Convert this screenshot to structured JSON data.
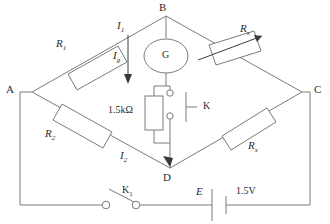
{
  "diagram": {
    "type": "wheatstone-bridge-circuit",
    "nodes": [
      {
        "id": "A",
        "label": "A"
      },
      {
        "id": "B",
        "label": "B"
      },
      {
        "id": "C",
        "label": "C"
      },
      {
        "id": "D",
        "label": "D"
      }
    ],
    "components": {
      "r1": {
        "label": "R",
        "sub": "1",
        "kind": "resistor"
      },
      "r2": {
        "label": "R",
        "sub": "2",
        "kind": "resistor"
      },
      "rs": {
        "label": "R",
        "sub": "s",
        "kind": "variable-resistor"
      },
      "rx": {
        "label": "R",
        "sub": "x",
        "kind": "resistor"
      },
      "galvanometer": {
        "label": "G",
        "kind": "galvanometer"
      },
      "protect_resistor": {
        "label": "1.5kΩ",
        "kind": "resistor"
      },
      "switch_k": {
        "label": "K",
        "kind": "switch"
      },
      "switch_k1": {
        "label": "K",
        "sub": "1",
        "kind": "knife-switch"
      },
      "battery": {
        "label": "E",
        "voltage": "1.5V",
        "kind": "battery"
      }
    },
    "currents": [
      {
        "label": "I",
        "sub": "1",
        "name": "i1"
      },
      {
        "label": "I",
        "sub": "g",
        "name": "ig"
      },
      {
        "label": "I",
        "sub": "2",
        "name": "i2"
      }
    ],
    "colors": {
      "wire": "#7a7a7a",
      "text": "#2b2b2b",
      "background": "#ffffff"
    }
  }
}
